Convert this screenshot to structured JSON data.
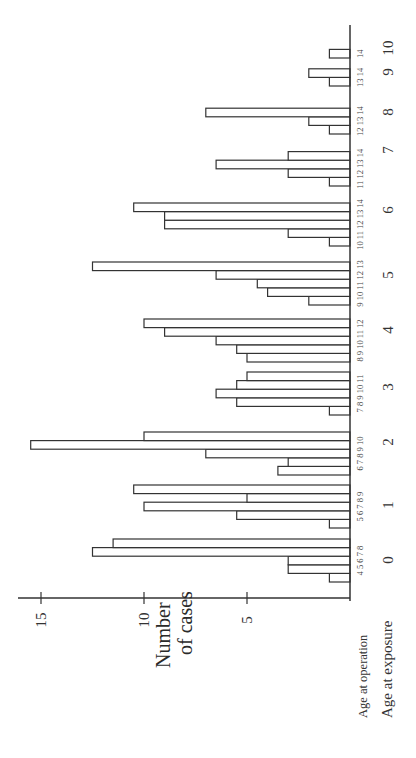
{
  "chart_data": {
    "type": "bar",
    "orientation": "rotated 90 degrees counter-clockwise (bars extend leftward from baseline on right)",
    "title": "",
    "ylabel": "Number of cases",
    "ylabel_lines": [
      "Number",
      "of cases"
    ],
    "xlabel_outer": "Age at exposure",
    "xlabel_inner": "Age at operation",
    "ylim": [
      0,
      15
    ],
    "yticks": [
      5,
      10,
      15
    ],
    "grid": false,
    "legend": null,
    "groups": [
      {
        "exposure_age": "0",
        "operation_ages": [
          "4",
          "5",
          "6",
          "7",
          "8"
        ],
        "values": [
          1,
          3,
          3,
          12.5,
          11.5
        ]
      },
      {
        "exposure_age": "1",
        "operation_ages": [
          "5",
          "6",
          "7",
          "8",
          "9"
        ],
        "values": [
          1,
          5.5,
          10,
          5,
          10.5
        ]
      },
      {
        "exposure_age": "2",
        "operation_ages": [
          "6",
          "7",
          "8",
          "9",
          "10"
        ],
        "values": [
          3.5,
          3,
          7,
          15.5,
          10
        ]
      },
      {
        "exposure_age": "3",
        "operation_ages": [
          "7",
          "8",
          "9",
          "10",
          "11"
        ],
        "values": [
          1,
          5.5,
          6.5,
          5.5,
          5
        ]
      },
      {
        "exposure_age": "4",
        "operation_ages": [
          "8",
          "9",
          "10",
          "11",
          "12"
        ],
        "values": [
          5,
          5.5,
          6.5,
          9,
          10
        ]
      },
      {
        "exposure_age": "5",
        "operation_ages": [
          "9",
          "10",
          "11",
          "12",
          "13"
        ],
        "values": [
          2,
          4,
          4.5,
          6.5,
          12.5
        ]
      },
      {
        "exposure_age": "6",
        "operation_ages": [
          "10",
          "11",
          "12",
          "13",
          "14"
        ],
        "values": [
          1,
          3,
          9,
          9,
          10.5
        ]
      },
      {
        "exposure_age": "7",
        "operation_ages": [
          "11",
          "12",
          "13",
          "14"
        ],
        "values": [
          1,
          3,
          6.5,
          3
        ]
      },
      {
        "exposure_age": "8",
        "operation_ages": [
          "12",
          "13",
          "14"
        ],
        "values": [
          1,
          2,
          7
        ]
      },
      {
        "exposure_age": "9",
        "operation_ages": [
          "13",
          "14"
        ],
        "values": [
          1,
          2
        ]
      },
      {
        "exposure_age": "10",
        "operation_ages": [
          "14"
        ],
        "values": [
          1
        ]
      }
    ],
    "categories": [
      "0",
      "1",
      "2",
      "3",
      "4",
      "5",
      "6",
      "7",
      "8",
      "9",
      "10"
    ]
  },
  "labels": {
    "y_axis_line1": "Number",
    "y_axis_line2": "of cases",
    "age_operation": "Age at operation",
    "age_exposure": "Age at exposure"
  },
  "style": {
    "bar_fill": "#ffffff",
    "bar_stroke": "#333333",
    "background": "#ffffff"
  }
}
